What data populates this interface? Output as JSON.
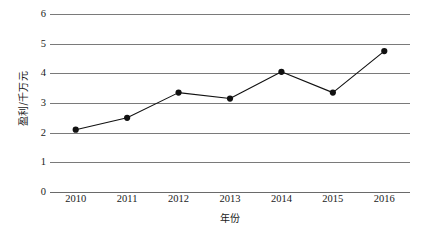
{
  "chart_data": {
    "type": "line",
    "title": "",
    "subtitle": "",
    "xlabel": "年份",
    "ylabel": "盈利/千万元",
    "categories": [
      "2010",
      "2011",
      "2012",
      "2013",
      "2014",
      "2015",
      "2016"
    ],
    "values": [
      2.1,
      2.5,
      3.35,
      3.15,
      4.05,
      3.35,
      4.75
    ],
    "series": [
      {
        "name": "盈利",
        "values": [
          2.1,
          2.5,
          3.35,
          3.15,
          4.05,
          3.35,
          4.75
        ]
      }
    ],
    "ylim": [
      0,
      6
    ],
    "ytick_values": [
      0,
      1,
      2,
      3,
      4,
      5,
      6
    ],
    "ytick_labels": [
      "0",
      "1",
      "2",
      "3",
      "4",
      "5",
      "6"
    ],
    "xtick_labels": [
      "2010",
      "2011",
      "2012",
      "2013",
      "2014",
      "2015",
      "2016"
    ],
    "grid": "horizontal",
    "legend": "none",
    "line_color": "#111111",
    "marker_color": "#111111",
    "marker_shape": "circle",
    "grid_color": "#7a7a7a",
    "background_color": "#ffffff",
    "annotations": []
  }
}
